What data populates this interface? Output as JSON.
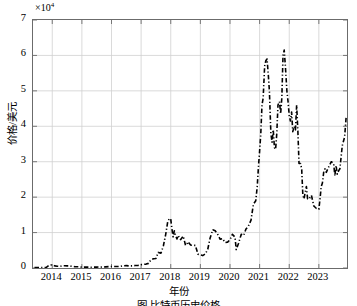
{
  "figure": {
    "exponent_label": "×10",
    "exponent_power": "4",
    "ylabel": "价格/美元",
    "xlabel": "年份",
    "caption": "图    比特币历史价格"
  },
  "chart_data": {
    "type": "line",
    "title": "",
    "xlabel": "年份",
    "ylabel": "价格/美元",
    "xlim": [
      2013.35,
      2023.95
    ],
    "ylim": [
      0,
      70000
    ],
    "y_scale_exponent": 10000,
    "grid": true,
    "legend": null,
    "line_style": "dash-dot",
    "line_color": "#000000",
    "line_width": 1.6,
    "xticks": [
      2014,
      2015,
      2016,
      2017,
      2018,
      2019,
      2020,
      2021,
      2022,
      2023
    ],
    "xtick_labels": [
      "2014",
      "2015",
      "2016",
      "2017",
      "2018",
      "2019",
      "2020",
      "2021",
      "2022",
      "2023"
    ],
    "yticks": [
      0,
      10000,
      20000,
      30000,
      40000,
      50000,
      60000,
      70000
    ],
    "ytick_labels": [
      "0",
      "1",
      "2",
      "3",
      "4",
      "5",
      "6",
      "7"
    ],
    "series": [
      {
        "name": "比特币价格",
        "x": [
          2013.4,
          2013.5,
          2013.6,
          2013.7,
          2013.8,
          2013.9,
          2014.0,
          2014.08,
          2014.17,
          2014.25,
          2014.33,
          2014.42,
          2014.5,
          2014.58,
          2014.67,
          2014.75,
          2014.83,
          2014.92,
          2015.0,
          2015.1,
          2015.2,
          2015.3,
          2015.4,
          2015.5,
          2015.6,
          2015.7,
          2015.8,
          2015.9,
          2016.0,
          2016.1,
          2016.2,
          2016.3,
          2016.4,
          2016.5,
          2016.6,
          2016.7,
          2016.8,
          2016.9,
          2017.0,
          2017.08,
          2017.17,
          2017.25,
          2017.33,
          2017.42,
          2017.5,
          2017.58,
          2017.67,
          2017.75,
          2017.83,
          2017.9,
          2017.96,
          2018.0,
          2018.04,
          2018.08,
          2018.12,
          2018.17,
          2018.21,
          2018.25,
          2018.33,
          2018.42,
          2018.5,
          2018.54,
          2018.58,
          2018.67,
          2018.75,
          2018.83,
          2018.92,
          2019.0,
          2019.08,
          2019.17,
          2019.25,
          2019.33,
          2019.42,
          2019.5,
          2019.58,
          2019.67,
          2019.75,
          2019.83,
          2019.92,
          2020.0,
          2020.08,
          2020.17,
          2020.21,
          2020.29,
          2020.38,
          2020.46,
          2020.54,
          2020.62,
          2020.71,
          2020.79,
          2020.87,
          2020.92,
          2020.96,
          2021.0,
          2021.04,
          2021.08,
          2021.12,
          2021.17,
          2021.21,
          2021.25,
          2021.29,
          2021.33,
          2021.38,
          2021.42,
          2021.46,
          2021.5,
          2021.54,
          2021.58,
          2021.62,
          2021.67,
          2021.71,
          2021.75,
          2021.79,
          2021.83,
          2021.87,
          2021.92,
          2021.96,
          2022.0,
          2022.04,
          2022.08,
          2022.12,
          2022.17,
          2022.21,
          2022.25,
          2022.29,
          2022.33,
          2022.38,
          2022.42,
          2022.46,
          2022.5,
          2022.54,
          2022.58,
          2022.62,
          2022.67,
          2022.75,
          2022.83,
          2022.92,
          2023.0,
          2023.04,
          2023.08,
          2023.12,
          2023.17,
          2023.21,
          2023.25,
          2023.33,
          2023.42,
          2023.5,
          2023.54,
          2023.58,
          2023.62,
          2023.67,
          2023.71,
          2023.79,
          2023.87,
          2023.92
        ],
        "y": [
          100,
          100,
          110,
          130,
          200,
          800,
          900,
          600,
          500,
          450,
          600,
          620,
          600,
          580,
          470,
          400,
          350,
          320,
          230,
          250,
          240,
          230,
          240,
          250,
          270,
          250,
          330,
          400,
          420,
          430,
          430,
          450,
          630,
          660,
          600,
          610,
          700,
          740,
          950,
          1050,
          1100,
          1300,
          2300,
          2600,
          2700,
          4400,
          4200,
          6200,
          9500,
          13200,
          14000,
          13800,
          11000,
          8800,
          10500,
          9000,
          8200,
          9200,
          8000,
          9000,
          6400,
          6600,
          7400,
          6500,
          6400,
          6400,
          3900,
          3700,
          3500,
          4000,
          5300,
          8500,
          10800,
          10500,
          9600,
          8100,
          8300,
          7200,
          7300,
          8000,
          9500,
          8700,
          5200,
          7000,
          9500,
          9200,
          11000,
          11800,
          13500,
          18000,
          19000,
          23000,
          28500,
          33000,
          38000,
          46000,
          48000,
          57000,
          58500,
          59000,
          55000,
          50000,
          38000,
          35500,
          39000,
          34000,
          33500,
          38000,
          46000,
          47000,
          43500,
          48000,
          60000,
          61500,
          57000,
          50000,
          47000,
          43000,
          41500,
          44000,
          38500,
          40000,
          39000,
          46000,
          39000,
          29500,
          29500,
          28000,
          20500,
          19500,
          21500,
          23000,
          19500,
          19500,
          20500,
          17500,
          16800,
          16600,
          19500,
          23000,
          24000,
          27500,
          28000,
          27000,
          28500,
          30000,
          29500,
          26000,
          29000,
          26500,
          27500,
          28000,
          34500,
          37000,
          42500
        ]
      }
    ]
  }
}
